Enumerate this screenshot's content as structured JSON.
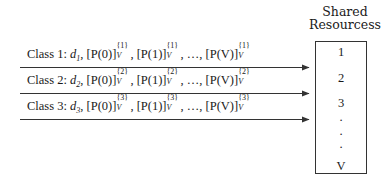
{
  "title": {
    "line1": "Shared",
    "line2": "Resourcess"
  },
  "classes": [
    {
      "label": "Class 1:",
      "d": "d",
      "d_sub": "1",
      "terms": [
        {
          "base": "[P(0)]",
          "sup": "{1}",
          "sub": "V"
        },
        {
          "base": "[P(1)]",
          "sup": "{1}",
          "sub": "V"
        },
        {
          "base": "[P(V)]",
          "sup": "{1}",
          "sub": "V"
        }
      ],
      "ellipsis": "…,"
    },
    {
      "label": "Class 2:",
      "d": "d",
      "d_sub": "2",
      "terms": [
        {
          "base": "[P(0)]",
          "sup": "{2}",
          "sub": "V"
        },
        {
          "base": "[P(1)]",
          "sup": "{2}",
          "sub": "V"
        },
        {
          "base": "[P(V)]",
          "sup": "{2}",
          "sub": "V"
        }
      ],
      "ellipsis": "…,"
    },
    {
      "label": "Class 3:",
      "d": "d",
      "d_sub": "3",
      "terms": [
        {
          "base": "[P(0)]",
          "sup": "{3}",
          "sub": "V"
        },
        {
          "base": "[P(1)]",
          "sup": "{3}",
          "sub": "V"
        },
        {
          "base": "[P(V)]",
          "sup": "{3}",
          "sub": "V"
        }
      ],
      "ellipsis": "…,"
    }
  ],
  "resources": {
    "items": [
      "1",
      "2",
      "3",
      "·",
      "·",
      "·",
      "V"
    ]
  },
  "colors": {
    "line": "#333333",
    "text": "#1a1a1a",
    "background": "#ffffff"
  }
}
